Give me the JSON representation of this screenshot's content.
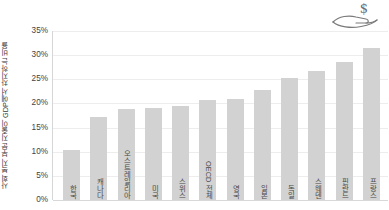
{
  "icon": {
    "name": "hand-holding-dollar-icon",
    "symbol": "$"
  },
  "chart_data": {
    "type": "bar",
    "title": "",
    "xlabel": "",
    "ylabel": "사회 복지 부문 지출이 GDP에서 차지하는 비율",
    "ylim": [
      0,
      35
    ],
    "ytick_labels": [
      "35%",
      "30%",
      "25%",
      "20%",
      "15%",
      "10%",
      "5%",
      "0%"
    ],
    "ytick_values": [
      35,
      30,
      25,
      20,
      15,
      10,
      5,
      0
    ],
    "grid": true,
    "legend": "none",
    "bar_color": "#d2d2d2",
    "categories": [
      "한국",
      "캐나다",
      "오스트레일리아",
      "미국",
      "스위스",
      "OECD 전체",
      "영국",
      "일본",
      "독일",
      "스웨덴",
      "핀란드",
      "프랑스"
    ],
    "values": [
      10.4,
      17.2,
      18.9,
      19.1,
      19.4,
      20.7,
      21.0,
      22.7,
      25.2,
      26.8,
      28.6,
      31.5
    ]
  }
}
